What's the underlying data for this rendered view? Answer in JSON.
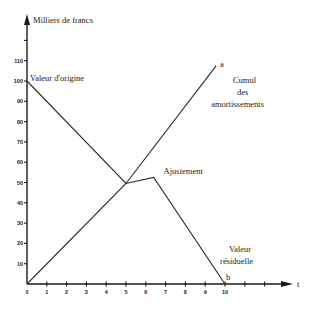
{
  "chart_data": {
    "type": "line",
    "title": "",
    "xlabel": "t",
    "ylabel": "Milliers de francs",
    "xlim": [
      0,
      13
    ],
    "ylim": [
      0,
      125
    ],
    "grid": false,
    "legend": "none",
    "x_ticks": [
      0,
      1,
      2,
      3,
      4,
      5,
      6,
      7,
      8,
      9,
      10,
      11,
      12
    ],
    "x_tick_labels": [
      "0",
      "1",
      "2",
      "3",
      "4",
      "5",
      "6",
      "7",
      "8",
      "9",
      "10",
      "",
      ""
    ],
    "y_ticks": [
      10,
      20,
      30,
      40,
      50,
      60,
      70,
      80,
      90,
      100,
      110,
      120
    ],
    "y_tick_labels": [
      "10",
      "20",
      "30",
      "40",
      "50",
      "60",
      "70",
      "80",
      "90",
      "100",
      "110",
      ""
    ],
    "series": [
      {
        "name": "Valeur (d'origine → ajustement → résiduelle)",
        "x": [
          0,
          5,
          6.4,
          10
        ],
        "y": [
          100,
          49.5,
          52.5,
          0
        ]
      },
      {
        "name": "Cumul des amortissements",
        "x": [
          0,
          5,
          9.55
        ],
        "y": [
          0,
          49.5,
          107.5
        ]
      }
    ],
    "annotations": [
      {
        "text": "Valeur d'origine",
        "x": 0.15,
        "y": 100
      },
      {
        "text": "Ajustement",
        "x": 6.9,
        "y": 54
      },
      {
        "text": "a",
        "x": 9.75,
        "y": 107
      },
      {
        "text": "Cumul",
        "x": 10.4,
        "y": 99
      },
      {
        "text": "des",
        "x": 10.6,
        "y": 93
      },
      {
        "text": "amortissements",
        "x": 9.3,
        "y": 87
      },
      {
        "text": "Valeur",
        "x": 10.2,
        "y": 16
      },
      {
        "text": "résiduelle",
        "x": 9.75,
        "y": 10
      },
      {
        "text": "b",
        "x": 10.05,
        "y": 2
      }
    ]
  },
  "layout": {
    "origin_px": [
      27,
      284
    ],
    "px_per_x": 19.8,
    "px_per_y": 2.03,
    "x_axis_end_px": 293,
    "y_axis_top_px": 14
  }
}
